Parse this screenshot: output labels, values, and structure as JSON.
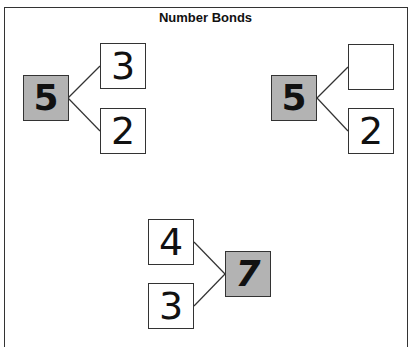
{
  "title": "Number Bonds",
  "bonds": [
    {
      "whole": "5",
      "parts": [
        "3",
        "2"
      ]
    },
    {
      "whole": "5",
      "parts": [
        "",
        "2"
      ]
    },
    {
      "whole": "7",
      "parts": [
        "4",
        "3"
      ]
    }
  ],
  "colors": {
    "whole_fill": "#b3b3b3",
    "border": "#333333"
  }
}
